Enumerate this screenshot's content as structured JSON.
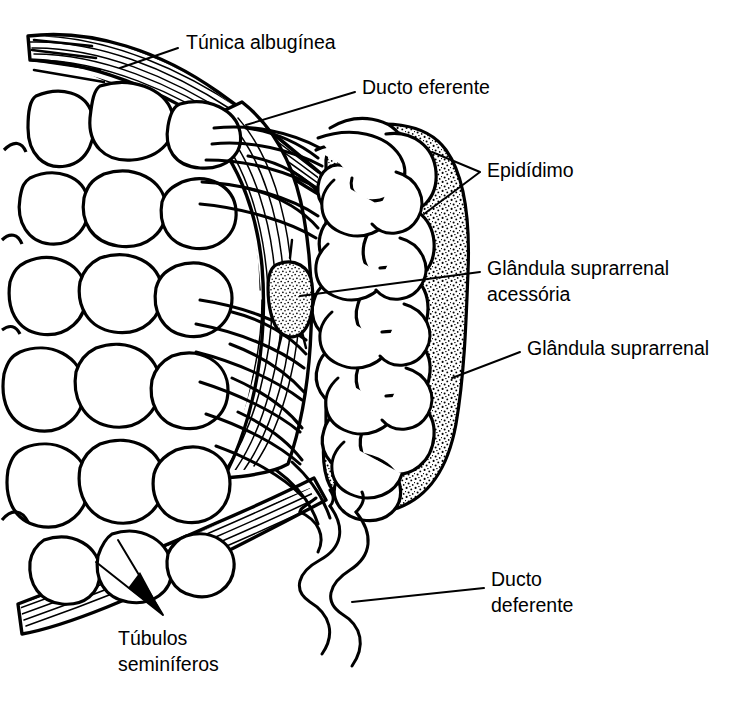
{
  "figure": {
    "background_color": "#ffffff",
    "line_color": "#000000",
    "width": 749,
    "height": 706
  },
  "labels": [
    {
      "id": "tunica-albuginea",
      "text": "Túnica albugínea",
      "line1": "Túnica albugínea",
      "line2": "",
      "x": 186,
      "y": 44,
      "anchor": "start",
      "leader": "M 178 48 L 120 68"
    },
    {
      "id": "ducto-eferente",
      "text": "Ducto eferente",
      "line1": "Ducto eferente",
      "line2": "",
      "x": 362,
      "y": 89,
      "anchor": "start",
      "leader": "M 355 92 L 246 125"
    },
    {
      "id": "epididimo",
      "text": "Epidídimo",
      "line1": "Epidídimo",
      "line2": "",
      "x": 487,
      "y": 172,
      "anchor": "start",
      "leader": "M 480 172 L 432 152 M 480 172 L 424 214"
    },
    {
      "id": "glandula-suprarrenal-acessoria",
      "text": "Glândula suprarrenal acessória",
      "line1": "Glândula suprarrenal",
      "line2": "acessória",
      "x": 487,
      "y": 268,
      "anchor": "start",
      "leader": "M 480 272 L 300 296"
    },
    {
      "id": "glandula-suprarrenal",
      "text": "Glândula suprarrenal",
      "line1": "Glândula suprarrenal",
      "line2": "",
      "x": 527,
      "y": 350,
      "anchor": "start",
      "leader": "M 520 352 L 452 378"
    },
    {
      "id": "ducto-deferente",
      "text": "Ducto deferente",
      "line1": "Ducto",
      "line2": "deferente",
      "x": 491,
      "y": 578,
      "anchor": "start",
      "leader": "M 484 588 L 352 602"
    },
    {
      "id": "tubulos-seminiferos",
      "text": "Túbulos seminíferos",
      "line1": "Túbulos",
      "line2": "seminíferos",
      "x": 118,
      "y": 637,
      "anchor": "start",
      "leader": "M 163 615 L 118 540 M 163 615 L 96 562"
    }
  ],
  "structures": [
    {
      "id": "tunica-albuginea-capsule",
      "name": "Túnica albugínea",
      "texture": "linhas paralelas finas (hachura)"
    },
    {
      "id": "seminiferous-lobules",
      "name": "Túbulos seminíferos",
      "texture": "contornos arredondados irregulares"
    },
    {
      "id": "efferent-ducts",
      "name": "Ductos eferentes",
      "texture": "tubos de linha dupla"
    },
    {
      "id": "epididymis",
      "name": "Epidídimo",
      "texture": "tubo enovelado pontilhado"
    },
    {
      "id": "accessory-adrenal",
      "name": "Glândula suprarrenal acessória",
      "texture": "massa oval pontilhada"
    },
    {
      "id": "adrenal-gland",
      "name": "Glândula suprarrenal",
      "texture": "massa reniforme pontilhada"
    },
    {
      "id": "vas-deferens",
      "name": "Ducto deferente",
      "texture": "tubo ondulado de linha dupla"
    }
  ]
}
